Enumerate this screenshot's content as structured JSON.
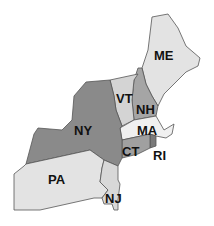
{
  "map": {
    "title": "",
    "region": "Northeastern United States",
    "states": [
      {
        "code": "ME",
        "label": "ME",
        "fill": "#e3e3e3"
      },
      {
        "code": "NH",
        "label": "NH",
        "fill": "#a5a5a5"
      },
      {
        "code": "VT",
        "label": "VT",
        "fill": "#d4d4d4"
      },
      {
        "code": "MA",
        "label": "MA",
        "fill": "#f0f0f0"
      },
      {
        "code": "RI",
        "label": "RI",
        "fill": "#7a7a7a"
      },
      {
        "code": "CT",
        "label": "CT",
        "fill": "#a0a0a0"
      },
      {
        "code": "NY",
        "label": "NY",
        "fill": "#8a8a8a"
      },
      {
        "code": "PA",
        "label": "PA",
        "fill": "#e3e3e3"
      },
      {
        "code": "NJ",
        "label": "NJ",
        "fill": "#d8d8d8"
      }
    ]
  }
}
